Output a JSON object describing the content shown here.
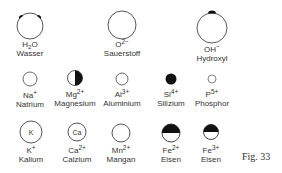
{
  "figure_label": "Fig. 33",
  "ions": [
    {
      "symbol": "H",
      "sub": "2",
      "rest": "O",
      "charge": "",
      "name": "Wasser",
      "cx": 30,
      "cy": 26,
      "r": 13,
      "fill": "none",
      "marks": "two-top"
    },
    {
      "symbol": "O",
      "sub": "",
      "rest": "",
      "charge": "2−",
      "name": "Sauerstoff",
      "cx": 122,
      "cy": 25,
      "r": 14,
      "fill": "none"
    },
    {
      "symbol": "OH",
      "sub": "",
      "rest": "",
      "charge": "−",
      "name": "Hydroxyl",
      "cx": 212,
      "cy": 28,
      "r": 15,
      "fill": "none",
      "marks": "one-top"
    },
    {
      "symbol": "Na",
      "sub": "",
      "rest": "",
      "charge": "+",
      "name": "Natrium",
      "cx": 30,
      "cy": 79,
      "r": 7,
      "fill": "none"
    },
    {
      "symbol": "Mg",
      "sub": "",
      "rest": "",
      "charge": "2+",
      "name": "Magnesium",
      "cx": 75,
      "cy": 78,
      "r": 7.5,
      "fill": "right-half"
    },
    {
      "symbol": "Al",
      "sub": "",
      "rest": "",
      "charge": "3+",
      "name": "Aluminium",
      "cx": 122,
      "cy": 79,
      "r": 6,
      "fill": "none"
    },
    {
      "symbol": "Si",
      "sub": "",
      "rest": "",
      "charge": "4+",
      "name": "Silizium",
      "cx": 171,
      "cy": 79,
      "r": 5.5,
      "fill": "full"
    },
    {
      "symbol": "P",
      "sub": "",
      "rest": "",
      "charge": "5+",
      "name": "Phosphor",
      "cx": 212,
      "cy": 79,
      "r": 4,
      "fill": "none"
    },
    {
      "symbol": "K",
      "sub": "",
      "rest": "",
      "charge": "+",
      "name": "Kalium",
      "cx": 31,
      "cy": 132,
      "r": 11,
      "fill": "none",
      "inner": "K"
    },
    {
      "symbol": "Ca",
      "sub": "",
      "rest": "",
      "charge": "2+",
      "name": "Calzium",
      "cx": 77,
      "cy": 132,
      "r": 9,
      "fill": "none",
      "inner": "Ca"
    },
    {
      "symbol": "Mn",
      "sub": "",
      "rest": "",
      "charge": "2+",
      "name": "Mangan",
      "cx": 121,
      "cy": 133,
      "r": 9,
      "fill": "none"
    },
    {
      "symbol": "Fe",
      "sub": "",
      "rest": "",
      "charge": "2+",
      "name": "Eisen",
      "cx": 171,
      "cy": 133,
      "r": 9,
      "fill": "top-half"
    },
    {
      "symbol": "Fe",
      "sub": "",
      "rest": "",
      "charge": "3+",
      "name": "Eisen",
      "cx": 211,
      "cy": 132,
      "r": 7.5,
      "fill": "top-half"
    }
  ]
}
